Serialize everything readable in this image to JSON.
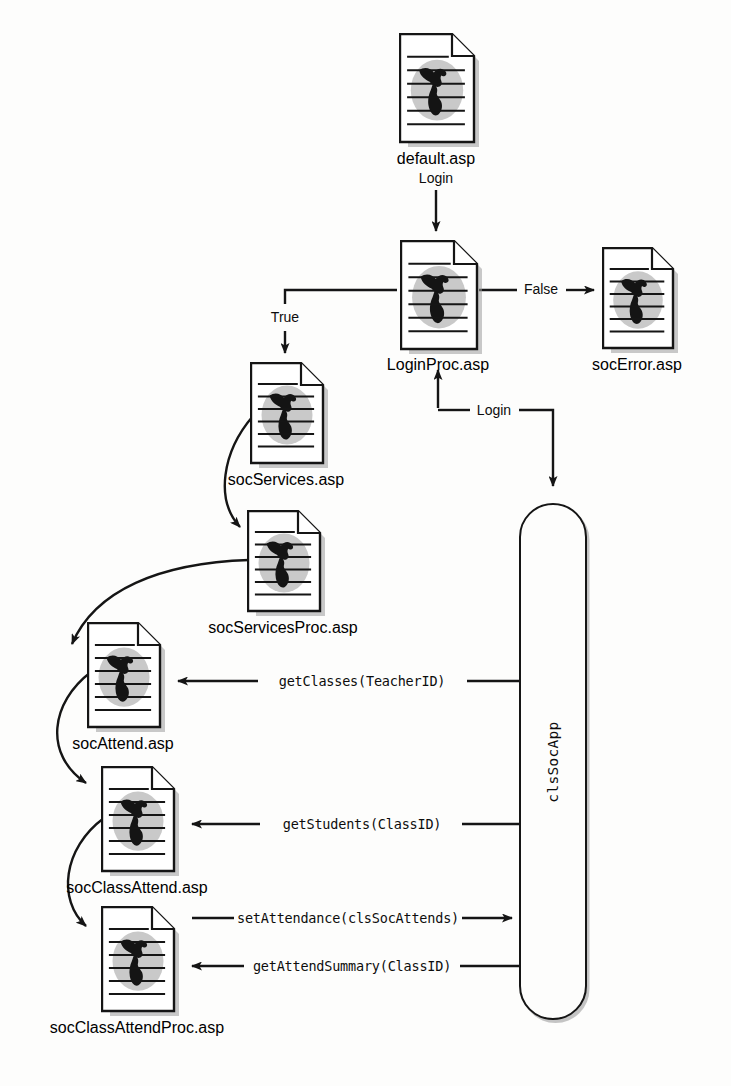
{
  "diagram": {
    "icon_name": "web-page-document-icon",
    "colors": {
      "ink": "#151515",
      "paper": "#ffffff",
      "globe_fill": "#c9c9c9",
      "shadow": "#9a9a9a",
      "background": "#fdfdfc"
    }
  },
  "nodes": [
    {
      "id": "default",
      "label": "default.asp",
      "sublabel": "Login",
      "x": 399,
      "y": 33,
      "w": 74,
      "h": 108,
      "cap_x": 436,
      "cap_y": 150,
      "cap_align": "ctr"
    },
    {
      "id": "loginproc",
      "label": "LoginProc.asp",
      "sublabel": "",
      "x": 400,
      "y": 240,
      "w": 76,
      "h": 108,
      "cap_x": 438,
      "cap_y": 356,
      "cap_align": "ctr"
    },
    {
      "id": "socerror",
      "label": "socError.asp",
      "sublabel": "",
      "x": 602,
      "y": 247,
      "w": 70,
      "h": 100,
      "cap_x": 637,
      "cap_y": 356,
      "cap_align": "ctr"
    },
    {
      "id": "socservices",
      "label": "socServices.asp",
      "sublabel": "",
      "x": 250,
      "y": 362,
      "w": 72,
      "h": 100,
      "cap_x": 286,
      "cap_y": 471,
      "cap_align": "ctr"
    },
    {
      "id": "socservicesproc",
      "label": "socServicesProc.asp",
      "sublabel": "",
      "x": 247,
      "y": 510,
      "w": 72,
      "h": 100,
      "cap_x": 283,
      "cap_y": 619,
      "cap_align": "ctr"
    },
    {
      "id": "socattend",
      "label": "socAttend.asp",
      "sublabel": "",
      "x": 87,
      "y": 622,
      "w": 72,
      "h": 104,
      "cap_x": 123,
      "cap_y": 735,
      "cap_align": "ctr"
    },
    {
      "id": "socclassattend",
      "label": "socClassAttend.asp",
      "sublabel": "",
      "x": 101,
      "y": 766,
      "w": 72,
      "h": 104,
      "cap_x": 137,
      "cap_y": 879,
      "cap_align": "ctr"
    },
    {
      "id": "socclassattendproc",
      "label": "socClassAttendProc.asp",
      "sublabel": "",
      "x": 101,
      "y": 906,
      "w": 72,
      "h": 104,
      "cap_x": 137,
      "cap_y": 1019,
      "cap_align": "ctr"
    }
  ],
  "component": {
    "id": "clssocapp",
    "label": "clsSocApp",
    "x": 519,
    "y": 503,
    "w": 68,
    "h": 517
  },
  "edge_labels": [
    {
      "id": "login-top",
      "text": "Login",
      "style": "sans",
      "x": 436,
      "y": 178
    },
    {
      "id": "false",
      "text": "False",
      "style": "sans",
      "x": 541,
      "y": 289
    },
    {
      "id": "true",
      "text": "True",
      "style": "sans",
      "x": 285,
      "y": 317
    },
    {
      "id": "login-return",
      "text": "Login",
      "style": "sans",
      "x": 494,
      "y": 410
    },
    {
      "id": "get-classes",
      "text": "getClasses(TeacherID)",
      "style": "mono",
      "x": 362,
      "y": 681
    },
    {
      "id": "get-students",
      "text": "getStudents(ClassID)",
      "style": "mono",
      "x": 362,
      "y": 824
    },
    {
      "id": "set-attendance",
      "text": "setAttendance(clsSocAttends)",
      "style": "mono",
      "x": 348,
      "y": 918
    },
    {
      "id": "get-attend-summary",
      "text": "getAttendSummary(ClassID)",
      "style": "mono",
      "x": 352,
      "y": 966
    }
  ],
  "edges": [
    {
      "id": "default-to-loginproc",
      "from": "default",
      "to": "loginproc",
      "label": "Login",
      "kind": "straight-down"
    },
    {
      "id": "loginproc-to-socerror",
      "from": "loginproc",
      "to": "socerror",
      "label": "False",
      "kind": "straight-right"
    },
    {
      "id": "loginproc-to-socservices",
      "from": "loginproc",
      "to": "socservices",
      "label": "True",
      "kind": "elbow-left-down"
    },
    {
      "id": "clssocapp-to-loginproc",
      "from": "clssocapp",
      "to": "loginproc",
      "label": "Login",
      "kind": "elbow-up"
    },
    {
      "id": "loginproc-to-clssocapp",
      "from": "loginproc",
      "to": "clssocapp",
      "label": "Login",
      "kind": "elbow-down"
    },
    {
      "id": "socservices-to-socservicesproc",
      "from": "socservices",
      "to": "socservicesproc",
      "label": "",
      "kind": "curve"
    },
    {
      "id": "socservicesproc-to-socattend",
      "from": "socservicesproc",
      "to": "socattend",
      "label": "",
      "kind": "curve"
    },
    {
      "id": "socattend-to-socclassattend",
      "from": "socattend",
      "to": "socclassattend",
      "label": "",
      "kind": "curve"
    },
    {
      "id": "socclassattend-to-proc",
      "from": "socclassattend",
      "to": "socclassattendproc",
      "label": "",
      "kind": "curve"
    },
    {
      "id": "clssocapp-to-socattend",
      "from": "clssocapp",
      "to": "socattend",
      "label": "getClasses(TeacherID)",
      "kind": "straight-left"
    },
    {
      "id": "clssocapp-to-socclassattend",
      "from": "clssocapp",
      "to": "socclassattend",
      "label": "getStudents(ClassID)",
      "kind": "straight-left"
    },
    {
      "id": "proc-to-clssocapp",
      "from": "socclassattendproc",
      "to": "clssocapp",
      "label": "setAttendance(clsSocAttends)",
      "kind": "straight-right"
    },
    {
      "id": "clssocapp-to-proc",
      "from": "clssocapp",
      "to": "socclassattendproc",
      "label": "getAttendSummary(ClassID)",
      "kind": "straight-left"
    }
  ]
}
